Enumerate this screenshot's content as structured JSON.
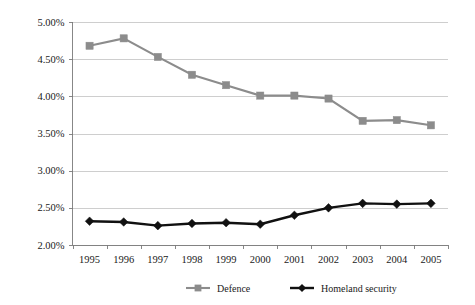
{
  "chart_data": {
    "type": "line",
    "title": "",
    "subtitle": "",
    "xlabel": "",
    "ylabel": "",
    "categories": [
      "1995",
      "1996",
      "1997",
      "1998",
      "1999",
      "2000",
      "2001",
      "2002",
      "2003",
      "2004",
      "2005"
    ],
    "series": [
      {
        "name": "Defence",
        "color": "#8c8c8c",
        "marker": "square",
        "values": [
          4.68,
          4.78,
          4.53,
          4.29,
          4.15,
          4.01,
          4.01,
          3.97,
          3.67,
          3.68,
          3.61
        ]
      },
      {
        "name": "Homeland security",
        "color": "#111111",
        "marker": "diamond",
        "values": [
          2.32,
          2.31,
          2.26,
          2.29,
          2.3,
          2.28,
          2.4,
          2.5,
          2.56,
          2.55,
          2.56
        ]
      }
    ],
    "ylim": [
      2.0,
      5.0
    ],
    "yticks": [
      2.0,
      2.5,
      3.0,
      3.5,
      4.0,
      4.5,
      5.0
    ],
    "ytick_labels": [
      "2.00%",
      "2.50%",
      "3.00%",
      "3.50%",
      "4.00%",
      "4.50%",
      "5.00%"
    ],
    "grid": true,
    "grid_axis": "y",
    "legend_position": "bottom",
    "legend_entries": [
      "Defence",
      "Homeland security"
    ],
    "value_format": "percent",
    "background_color": "#ffffff",
    "gridline_color": "#b9b9b9",
    "axis_color": "#7a7a7a"
  }
}
